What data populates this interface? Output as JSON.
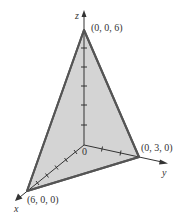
{
  "diagram": {
    "type": "3d-plane-triangle",
    "axes": {
      "x": {
        "label": "x"
      },
      "y": {
        "label": "y"
      },
      "z": {
        "label": "z"
      },
      "origin_label": "0"
    },
    "vertices": [
      {
        "name": "z-intercept",
        "label": "(0, 0, 6)"
      },
      {
        "name": "y-intercept",
        "label": "(0, 3, 0)"
      },
      {
        "name": "x-intercept",
        "label": "(6, 0, 0)"
      }
    ],
    "colors": {
      "plane_fill": "#d4d4d4",
      "plane_edge": "#555555",
      "axis": "#333333",
      "background": "#ffffff"
    }
  }
}
